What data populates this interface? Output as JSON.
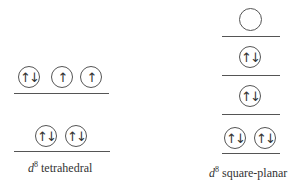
{
  "diagrams": [
    {
      "name": "tetrahedral",
      "label_prefix": "d",
      "label_superscript": "8",
      "label_text": " tetrahedral",
      "levels": [
        {
          "position": "upper",
          "orbitals": [
            "↑↓",
            "↑",
            "↑"
          ]
        },
        {
          "position": "lower",
          "orbitals": [
            "↑↓",
            "↑↓"
          ]
        }
      ]
    },
    {
      "name": "square-planar",
      "label_prefix": "d",
      "label_superscript": "8",
      "label_text": " square-planar",
      "levels": [
        {
          "position": "level-4",
          "orbitals": [
            ""
          ]
        },
        {
          "position": "level-3",
          "orbitals": [
            "↑↓"
          ]
        },
        {
          "position": "level-2",
          "orbitals": [
            "↑↓"
          ]
        },
        {
          "position": "level-1",
          "orbitals": [
            "↑↓",
            "↑↓"
          ]
        }
      ]
    }
  ]
}
